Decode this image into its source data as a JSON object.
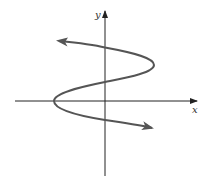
{
  "diagram": {
    "type": "graph-of-relation",
    "axes": {
      "x_label": "x",
      "y_label": "y",
      "color": "#222222"
    },
    "curve": {
      "color": "#555555",
      "stroke_width": 2,
      "arrow_start": "upper-left",
      "arrow_end": "lower-right",
      "shape": "S-shaped curve opening horizontally: right turning point above x-axis, left turning point on negative x-axis; crosses y-axis three times"
    }
  }
}
